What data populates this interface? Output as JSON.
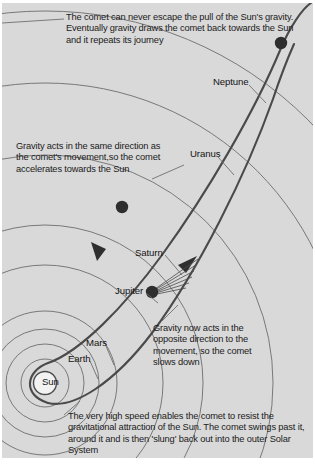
{
  "figure": {
    "background_color": "#d9d9d9",
    "ink_color": "#3a3a3a",
    "text_color": "#1b1b1b"
  },
  "notes": {
    "top": "The comet can never escape the pull of the Sun's gravity. Eventually gravity draws the comet back towards the Sun and it repeats its journey",
    "left": "Gravity acts in the same direction as the comet's movement,so the comet accelerates towards the Sun",
    "right": "Gravity now acts in the opposite direction to the movement, so the comet slows down",
    "bottom": "The very high speed enables the comet to resist the gravitational attraction of the Sun. The comet swings past it, around it and is then 'slung' back out into the outer Solar System"
  },
  "planets": [
    {
      "key": "sun",
      "label": "Sun"
    },
    {
      "key": "earth",
      "label": "Earth"
    },
    {
      "key": "mars",
      "label": "Mars"
    },
    {
      "key": "jupiter",
      "label": "Jupiter"
    },
    {
      "key": "saturn",
      "label": "Saturn"
    },
    {
      "key": "uranus",
      "label": "Uranus"
    },
    {
      "key": "neptune",
      "label": "Neptune"
    }
  ],
  "comet_markers": [
    {
      "key": "aphelion",
      "cx": 279,
      "cy": 40,
      "r": 6.2
    },
    {
      "key": "inbound",
      "cx": 120,
      "cy": 204,
      "r": 6.2
    },
    {
      "key": "perihelion_exit",
      "cx": 150,
      "cy": 289,
      "r": 6.2
    }
  ],
  "icons": {
    "sun": "sun-icon",
    "comet": "comet-icon",
    "arrow_inbound": "arrow-down-icon",
    "arrow_outbound": "arrow-up-icon"
  }
}
